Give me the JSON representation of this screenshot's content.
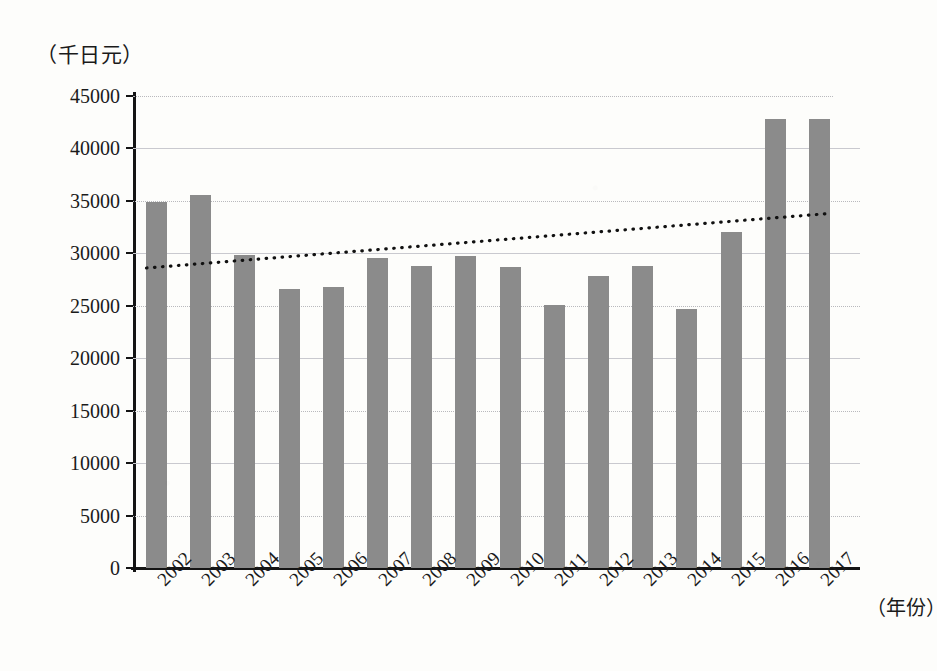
{
  "chart_data": {
    "type": "bar",
    "title": "",
    "subtitle": "",
    "xlabel": "（年份）",
    "ylabel": "（千日元）",
    "ylim": [
      0,
      45000
    ],
    "ytick_step": 5000,
    "ytick_labels": [
      "45000",
      "40000",
      "35000",
      "30000",
      "25000",
      "20000",
      "15000",
      "10000",
      "5000",
      "0"
    ],
    "ytick_values": [
      45000,
      40000,
      35000,
      30000,
      25000,
      20000,
      15000,
      10000,
      5000,
      0
    ],
    "grid": true,
    "legend": "none",
    "categories": [
      "2002",
      "2003",
      "2004",
      "2005",
      "2006",
      "2007",
      "2008",
      "2009",
      "2010",
      "2011",
      "2012",
      "2013",
      "2014",
      "2015",
      "2016",
      "2017"
    ],
    "values": [
      34900,
      35600,
      29800,
      26600,
      26800,
      29600,
      28800,
      29700,
      28700,
      25100,
      27800,
      28800,
      24700,
      32000,
      42800,
      42800
    ],
    "series": [
      {
        "name": "年度金额",
        "type": "bar",
        "color": "#8b8b8b",
        "values": [
          34900,
          35600,
          29800,
          26600,
          26800,
          29600,
          28800,
          29700,
          28700,
          25100,
          27800,
          28800,
          24700,
          32000,
          42800,
          42800
        ]
      },
      {
        "name": "趋势线",
        "type": "line",
        "style": "dotted",
        "color": "#111111",
        "start_value": 28600,
        "end_value": 33800
      }
    ],
    "annotations": []
  },
  "colors": {
    "bar": "#8b8b8b",
    "axis": "#141414",
    "grid": "#b9b9bd",
    "trendline": "#111111",
    "background": "#fdfdfb"
  }
}
